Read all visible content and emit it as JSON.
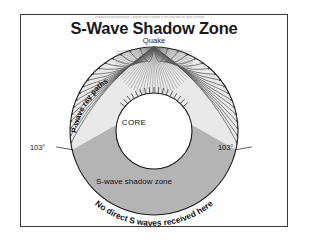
{
  "slide": {
    "credit_line": "Reproduced with permission. Copyright notice illegible at this resolution. All rights reserved.",
    "title": "S-Wave Shadow Zone",
    "source_label": "Quake"
  },
  "diagram": {
    "type": "cross-section",
    "core_label": "CORE",
    "shadow_zone_label": "S-wave shadow zone",
    "ray_paths_label": "P-wave ray paths",
    "arc_caption": "No direct S waves received here",
    "angle_left": "103°",
    "angle_right": "103°",
    "colors": {
      "mantle_fill": "#e9e9e9",
      "shadow_fill": "#b4b4b4",
      "core_fill": "#ffffff",
      "outline": "#1a1a1a",
      "ray": "#585858",
      "frame": "#3a3a3a",
      "text": "#111111"
    },
    "geometry": {
      "earth_center_x": 134,
      "earth_center_y": 117,
      "earth_radius": 84,
      "core_radius": 38,
      "quake_x": 134,
      "quake_y": 33,
      "shadow_boundary_angle_deg": 103
    },
    "ray_count": 34
  }
}
